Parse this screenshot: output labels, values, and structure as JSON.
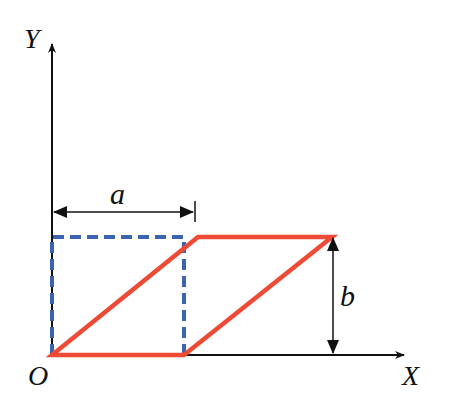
{
  "diagram": {
    "axes": {
      "x_label": "X",
      "y_label": "Y",
      "origin_label": "O"
    },
    "dimensions": {
      "width_label": "a",
      "height_label": "b"
    },
    "shapes": [
      {
        "name": "original-square",
        "style": "dashed",
        "color": "#3d64b0"
      },
      {
        "name": "sheared-parallelogram",
        "style": "solid",
        "color": "#ee4a36"
      }
    ],
    "colors": {
      "axis": "#111111",
      "square": "#3d64b0",
      "parallelogram": "#ee4a36"
    }
  }
}
